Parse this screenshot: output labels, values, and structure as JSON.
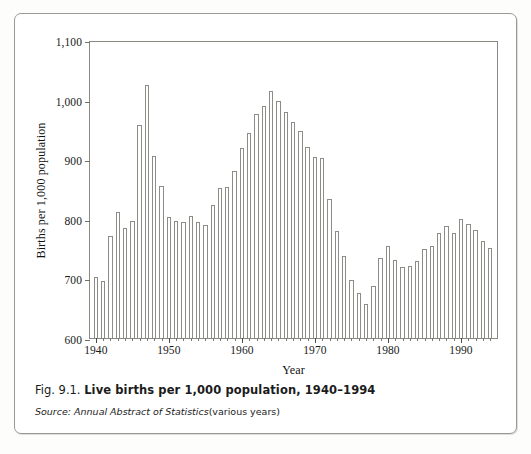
{
  "figure": {
    "caption_number": "Fig. 9.1.",
    "caption_title": "Live births per 1,000 population, 1940–1994",
    "source_label": "Source:",
    "source_title": "Annual Abstract of Statistics",
    "source_note": "(various years)"
  },
  "chart_data": {
    "type": "bar",
    "title": "Live births per 1,000 population, 1940–1994",
    "xlabel": "Year",
    "ylabel": "Births per 1,000 population",
    "ylim": [
      600,
      1100
    ],
    "ytick_labels": [
      "600",
      "700",
      "800",
      "900",
      "1,000",
      "1,100"
    ],
    "yticks": [
      600,
      700,
      800,
      900,
      1000,
      1100
    ],
    "xlim": [
      1939.2,
      1995.2
    ],
    "xtick_labels": [
      "1940",
      "1950",
      "1960",
      "1970",
      "1980",
      "1990"
    ],
    "xticks": [
      1940,
      1950,
      1960,
      1970,
      1980,
      1990
    ],
    "grid": false,
    "legend": null,
    "categories": [
      "1940",
      "1941",
      "1942",
      "1943",
      "1944",
      "1945",
      "1946",
      "1947",
      "1948",
      "1949",
      "1950",
      "1951",
      "1952",
      "1953",
      "1954",
      "1955",
      "1956",
      "1957",
      "1958",
      "1959",
      "1960",
      "1961",
      "1962",
      "1963",
      "1964",
      "1965",
      "1966",
      "1967",
      "1968",
      "1969",
      "1970",
      "1971",
      "1972",
      "1973",
      "1974",
      "1975",
      "1976",
      "1977",
      "1978",
      "1979",
      "1980",
      "1981",
      "1982",
      "1983",
      "1984",
      "1985",
      "1986",
      "1987",
      "1988",
      "1989",
      "1990",
      "1991",
      "1992",
      "1993",
      "1994"
    ],
    "values": [
      702,
      696,
      772,
      811,
      784,
      796,
      957,
      1025,
      905,
      855,
      803,
      797,
      794,
      804,
      795,
      789,
      824,
      851,
      854,
      880,
      918,
      944,
      976,
      990,
      1015,
      997,
      980,
      962,
      947,
      920,
      904,
      902,
      834,
      780,
      737,
      698,
      675,
      657,
      687,
      735,
      754,
      731,
      719,
      721,
      730,
      750,
      755,
      776,
      788,
      777,
      799,
      792,
      781,
      762,
      751
    ],
    "series": [
      {
        "name": "Live births per 1,000 population",
        "values": [
          702,
          696,
          772,
          811,
          784,
          796,
          957,
          1025,
          905,
          855,
          803,
          797,
          794,
          804,
          795,
          789,
          824,
          851,
          854,
          880,
          918,
          944,
          976,
          990,
          1015,
          997,
          980,
          962,
          947,
          920,
          904,
          902,
          834,
          780,
          737,
          698,
          675,
          657,
          687,
          735,
          754,
          731,
          719,
          721,
          730,
          750,
          755,
          776,
          788,
          777,
          799,
          792,
          781,
          762,
          751
        ]
      }
    ]
  },
  "colors": {
    "bar_fill": "#ffffff",
    "bar_stroke": "#8d8d88",
    "axis": "#8a8a85",
    "text": "#1a1a1a",
    "frame": "#9a9a95",
    "page_background": "#fdfdfc"
  }
}
